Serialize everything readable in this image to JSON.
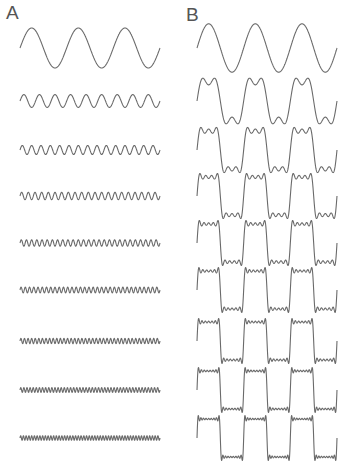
{
  "figure": {
    "panels": [
      {
        "id": "A",
        "label": "A",
        "description": "Individual odd harmonics sin(nx)/n"
      },
      {
        "id": "B",
        "label": "B",
        "description": "Cumulative sum of harmonics approaching a square wave"
      }
    ],
    "stroke_color": "#6a6a6a",
    "background": "#ffffff"
  },
  "chart_data": {
    "type": "line",
    "title": "",
    "panels": [
      "A",
      "B"
    ],
    "cycles_shown": 3,
    "harmonics": [
      1,
      3,
      5,
      7,
      9,
      11,
      13,
      15,
      17
    ],
    "panel_A_rows": [
      {
        "harmonic": 1,
        "amplitude": 1.0
      },
      {
        "harmonic": 3,
        "amplitude": 0.333
      },
      {
        "harmonic": 5,
        "amplitude": 0.2
      },
      {
        "harmonic": 7,
        "amplitude": 0.143
      },
      {
        "harmonic": 9,
        "amplitude": 0.111
      },
      {
        "harmonic": 11,
        "amplitude": 0.091
      },
      {
        "harmonic": 13,
        "amplitude": 0.077
      },
      {
        "harmonic": 15,
        "amplitude": 0.067
      },
      {
        "harmonic": 17,
        "amplitude": 0.059
      }
    ],
    "panel_B_rows": [
      {
        "terms": 1
      },
      {
        "terms": 2
      },
      {
        "terms": 3
      },
      {
        "terms": 4
      },
      {
        "terms": 5
      },
      {
        "terms": 6
      },
      {
        "terms": 7
      },
      {
        "terms": 8
      },
      {
        "terms": 9
      }
    ],
    "row_y_centers": [
      48,
      101,
      150,
      196,
      243,
      290,
      341,
      390,
      438
    ],
    "layout": {
      "A": {
        "x0": 20,
        "x1": 160
      },
      "B": {
        "x0": 197,
        "x1": 337
      },
      "row_amplitude_px": 20
    }
  }
}
